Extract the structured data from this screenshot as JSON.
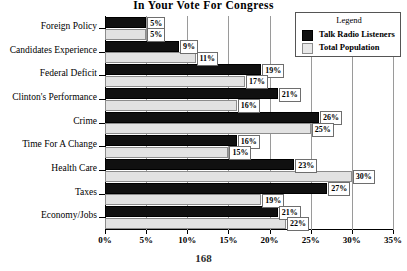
{
  "chart_data": {
    "type": "bar",
    "orientation": "horizontal",
    "title": "In Your Vote For Congress",
    "xlabel": "",
    "ylabel": "",
    "xlim": [
      0,
      35
    ],
    "xtick_labels": [
      "0%",
      "5%",
      "10%",
      "15%",
      "20%",
      "25%",
      "30%",
      "35%"
    ],
    "xtick_values": [
      0,
      5,
      10,
      15,
      20,
      25,
      30,
      35
    ],
    "grid": true,
    "legend_position": "top-right",
    "legend_title": "Legend",
    "categories": [
      "Foreign Policy",
      "Candidates Experience",
      "Federal Deficit",
      "Clinton's Performance",
      "Crime",
      "Time For A Change",
      "Health Care",
      "Taxes",
      "Economy/Jobs"
    ],
    "series": [
      {
        "name": "Talk Radio Listeners",
        "color": "#101010",
        "values": [
          5,
          9,
          19,
          21,
          26,
          16,
          23,
          27,
          21
        ],
        "labels": [
          "5%",
          "9%",
          "19%",
          "21%",
          "26%",
          "16%",
          "23%",
          "27%",
          "21%"
        ]
      },
      {
        "name": "Total Population",
        "color": "#e2e2e2",
        "values": [
          5,
          11,
          17,
          16,
          25,
          15,
          30,
          19,
          22
        ],
        "labels": [
          "5%",
          "11%",
          "17%",
          "16%",
          "25%",
          "15%",
          "30%",
          "19%",
          "22%"
        ]
      }
    ]
  },
  "page": {
    "number": "168"
  }
}
